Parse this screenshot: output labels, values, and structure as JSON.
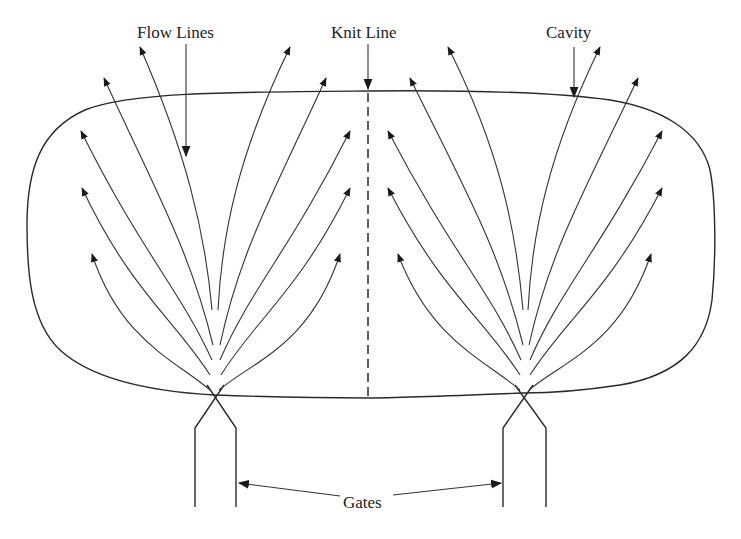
{
  "diagram": {
    "labels": {
      "flow_lines": "Flow Lines",
      "knit_line": "Knit Line",
      "cavity": "Cavity",
      "gates": "Gates"
    },
    "elements": {
      "cavity": "rounded cavity outline",
      "knit_line": "dashed vertical line at the center where the two flow fronts meet",
      "gates": [
        "left gate",
        "right gate"
      ],
      "flow_fans": [
        {
          "gate": "left",
          "arrow_count": 10
        },
        {
          "gate": "right",
          "arrow_count": 10
        }
      ]
    },
    "colors": {
      "ink": "#2a2a2a",
      "background": "#ffffff"
    }
  }
}
